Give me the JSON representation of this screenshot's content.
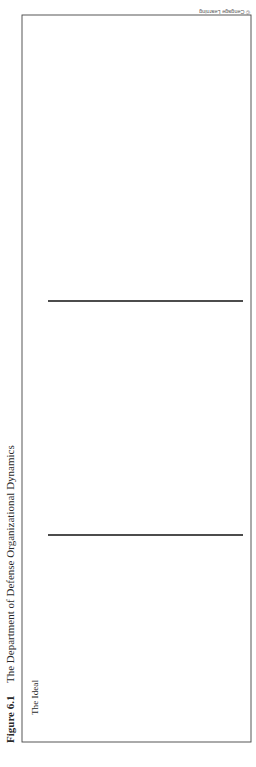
{
  "figure": {
    "number": "Figure 6.1",
    "title": "The Department of Defense Organizational Dynamics",
    "credit": "© Cengage Learning"
  },
  "panels": [
    {
      "title": "The Ideal",
      "nodes": [
        "OSD",
        "JCS",
        "Services"
      ],
      "annotations": {
        "osd": [
          "Office of the",
          "Secretary of",
          "Defense"
        ],
        "jcs": [
          "Joint",
          "Chiefs",
          "of Staff"
        ]
      }
    },
    {
      "title": "Post–WWII Reality",
      "nodes": [
        "OSD",
        "JCS",
        "Services"
      ],
      "processes": {
        "advisory": [
          "Advisory",
          "Process"
        ],
        "operational": [
          "Operational",
          "Process"
        ],
        "administrative": [
          "Administrative",
          "Process"
        ]
      }
    },
    {
      "title": "Post–Goldwater-Nichols Reality",
      "nodes": [
        "OSD",
        "CJCS",
        "COCOMs",
        "Services"
      ],
      "processes": {
        "advisory": [
          "Advisory",
          "Process"
        ],
        "operational": [
          "Operational",
          "Process"
        ],
        "administrative": [
          "Administrative",
          "Process"
        ]
      }
    }
  ]
}
